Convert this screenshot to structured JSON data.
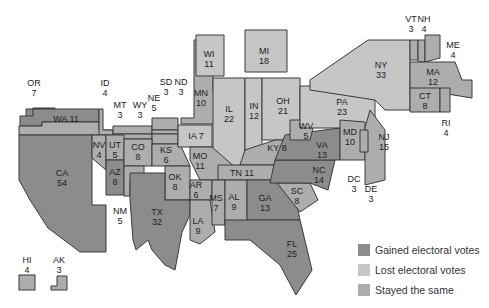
{
  "colors": {
    "gained": "#8c8c8c",
    "lost": "#c6c6c6",
    "same": "#adadad"
  },
  "legend": [
    {
      "key": "gained",
      "label": "Gained electoral votes"
    },
    {
      "key": "lost",
      "label": "Lost electoral votes"
    },
    {
      "key": "same",
      "label": "Stayed the same"
    }
  ],
  "states": {
    "WA": {
      "abbr": "WA",
      "votes": "11",
      "status": "same"
    },
    "OR": {
      "abbr": "OR",
      "votes": "7",
      "status": "same"
    },
    "ID": {
      "abbr": "ID",
      "votes": "4",
      "status": "same"
    },
    "MT": {
      "abbr": "MT",
      "votes": "3",
      "status": "same"
    },
    "WY": {
      "abbr": "WY",
      "votes": "3",
      "status": "same"
    },
    "NE": {
      "abbr": "NE",
      "votes": "5",
      "status": "same"
    },
    "SD": {
      "abbr": "SD",
      "votes": "3",
      "status": "same"
    },
    "ND": {
      "abbr": "ND",
      "votes": "3",
      "status": "same"
    },
    "MN": {
      "abbr": "MN",
      "votes": "10",
      "status": "same"
    },
    "WI": {
      "abbr": "WI",
      "votes": "11",
      "status": "lost"
    },
    "MI": {
      "abbr": "MI",
      "votes": "18",
      "status": "lost"
    },
    "IA": {
      "abbr": "IA",
      "votes": "7",
      "status": "lost"
    },
    "IL": {
      "abbr": "IL",
      "votes": "22",
      "status": "lost"
    },
    "IN": {
      "abbr": "IN",
      "votes": "12",
      "status": "lost"
    },
    "OH": {
      "abbr": "OH",
      "votes": "21",
      "status": "lost"
    },
    "PA": {
      "abbr": "PA",
      "votes": "23",
      "status": "lost"
    },
    "NY": {
      "abbr": "NY",
      "votes": "33",
      "status": "lost"
    },
    "VT": {
      "abbr": "VT",
      "votes": "3",
      "status": "same"
    },
    "NH": {
      "abbr": "NH",
      "votes": "4",
      "status": "same"
    },
    "ME": {
      "abbr": "ME",
      "votes": "4",
      "status": "same"
    },
    "MA": {
      "abbr": "MA",
      "votes": "12",
      "status": "same"
    },
    "CT": {
      "abbr": "CT",
      "votes": "8",
      "status": "same"
    },
    "RI": {
      "abbr": "RI",
      "votes": "4",
      "status": "same"
    },
    "NJ": {
      "abbr": "NJ",
      "votes": "15",
      "status": "same"
    },
    "DE": {
      "abbr": "DE",
      "votes": "3",
      "status": "same"
    },
    "MD": {
      "abbr": "MD",
      "votes": "10",
      "status": "same"
    },
    "DC": {
      "abbr": "DC",
      "votes": "3",
      "status": "same"
    },
    "WV": {
      "abbr": "WV",
      "votes": "5",
      "status": "same"
    },
    "VA": {
      "abbr": "VA",
      "votes": "13",
      "status": "gained"
    },
    "NC": {
      "abbr": "NC",
      "votes": "14",
      "status": "gained"
    },
    "SC": {
      "abbr": "SC",
      "votes": "8",
      "status": "same"
    },
    "GA": {
      "abbr": "GA",
      "votes": "13",
      "status": "gained"
    },
    "FL": {
      "abbr": "FL",
      "votes": "25",
      "status": "gained"
    },
    "AL": {
      "abbr": "AL",
      "votes": "9",
      "status": "same"
    },
    "MS": {
      "abbr": "MS",
      "votes": "7",
      "status": "same"
    },
    "TN": {
      "abbr": "TN",
      "votes": "11",
      "status": "same"
    },
    "KY": {
      "abbr": "KY",
      "votes": "8",
      "status": "same"
    },
    "MO": {
      "abbr": "MO",
      "votes": "11",
      "status": "same"
    },
    "AR": {
      "abbr": "AR",
      "votes": "6",
      "status": "same"
    },
    "LA": {
      "abbr": "LA",
      "votes": "9",
      "status": "same"
    },
    "OK": {
      "abbr": "OK",
      "votes": "8",
      "status": "same"
    },
    "KS": {
      "abbr": "KS",
      "votes": "6",
      "status": "same"
    },
    "TX": {
      "abbr": "TX",
      "votes": "32",
      "status": "gained"
    },
    "NM": {
      "abbr": "NM",
      "votes": "5",
      "status": "same"
    },
    "CO": {
      "abbr": "CO",
      "votes": "8",
      "status": "same"
    },
    "UT": {
      "abbr": "UT",
      "votes": "5",
      "status": "same"
    },
    "AZ": {
      "abbr": "AZ",
      "votes": "8",
      "status": "gained"
    },
    "NV": {
      "abbr": "NV",
      "votes": "4",
      "status": "same"
    },
    "CA": {
      "abbr": "CA",
      "votes": "54",
      "status": "gained"
    },
    "HI": {
      "abbr": "HI",
      "votes": "4",
      "status": "same"
    },
    "AK": {
      "abbr": "AK",
      "votes": "3",
      "status": "same"
    }
  }
}
